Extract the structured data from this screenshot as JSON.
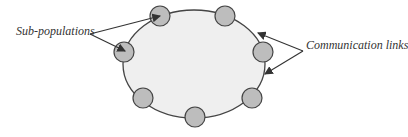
{
  "diagram": {
    "labels": {
      "subpopulations": "Sub-populations",
      "communication_links": "Communication links"
    },
    "colors": {
      "ring_fill": "#efefef",
      "node_fill": "#bdbdbd",
      "stroke": "#444444"
    },
    "node_count": 7
  }
}
